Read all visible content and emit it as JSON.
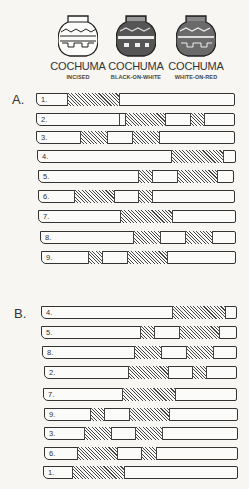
{
  "pots": [
    {
      "title": "COCHUMA",
      "subtitle": "INCISED",
      "style": "incised"
    },
    {
      "title": "COCHUMA",
      "subtitle": "BLACK-ON-WHITE",
      "style": "black-on-white"
    },
    {
      "title": "COCHUMA",
      "subtitle": "WHITE-ON-RED",
      "style": "white-on-red"
    }
  ],
  "sections": [
    {
      "label": "A.",
      "rows": [
        {
          "num": "1.",
          "y": 93,
          "x0": 36,
          "x1": 235,
          "hatches": [
            [
              66,
              117
            ]
          ]
        },
        {
          "num": "2.",
          "y": 113,
          "x0": 36,
          "x1": 235,
          "hatches": [
            [
              124,
              163
            ],
            [
              189,
              202
            ]
          ],
          "divider": 118
        },
        {
          "num": "3.",
          "y": 131,
          "x0": 36,
          "x1": 235,
          "hatches": [
            [
              79,
              105
            ],
            [
              131,
              157
            ]
          ]
        },
        {
          "num": "4.",
          "y": 150,
          "x0": 37,
          "x1": 236,
          "hatches": [
            [
              170,
              221
            ]
          ]
        },
        {
          "num": "5.",
          "y": 170,
          "x0": 38,
          "x1": 234,
          "hatches": [
            [
              137,
              150
            ],
            [
              176,
              215
            ]
          ]
        },
        {
          "num": "6.",
          "y": 190,
          "x0": 38,
          "x1": 235,
          "hatches": [
            [
              73,
              112
            ],
            [
              137,
              150
            ]
          ]
        },
        {
          "num": "7.",
          "y": 210,
          "x0": 38,
          "x1": 236,
          "hatches": [
            [
              119,
              170
            ]
          ]
        },
        {
          "num": "8.",
          "y": 231,
          "x0": 40,
          "x1": 236,
          "hatches": [
            [
              132,
              158
            ],
            [
              184,
              210
            ]
          ]
        },
        {
          "num": "9.",
          "y": 251,
          "x0": 41,
          "x1": 236,
          "hatches": [
            [
              87,
              100
            ],
            [
              126,
              165
            ]
          ]
        }
      ]
    },
    {
      "label": "B.",
      "rows": [
        {
          "num": "4.",
          "y": 306,
          "x0": 41,
          "x1": 237,
          "hatches": [
            [
              171,
              223
            ]
          ]
        },
        {
          "num": "5.",
          "y": 326,
          "x0": 41,
          "x1": 237,
          "hatches": [
            [
              139,
              152
            ],
            [
              178,
              217
            ]
          ]
        },
        {
          "num": "8.",
          "y": 346,
          "x0": 42,
          "x1": 237,
          "hatches": [
            [
              133,
              159
            ],
            [
              185,
              211
            ]
          ]
        },
        {
          "num": "2.",
          "y": 366,
          "x0": 44,
          "x1": 237,
          "hatches": [
            [
              127,
              166
            ],
            [
              191,
              204
            ]
          ]
        },
        {
          "num": "7.",
          "y": 388,
          "x0": 43,
          "x1": 237,
          "hatches": [
            [
              121,
              173
            ]
          ]
        },
        {
          "num": "9.",
          "y": 408,
          "x0": 44,
          "x1": 238,
          "hatches": [
            [
              89,
              102
            ],
            [
              128,
              167
            ]
          ]
        },
        {
          "num": "3.",
          "y": 427,
          "x0": 44,
          "x1": 238,
          "hatches": [
            [
              83,
              109
            ],
            [
              134,
              160
            ]
          ]
        },
        {
          "num": "6.",
          "y": 447,
          "x0": 44,
          "x1": 238,
          "hatches": [
            [
              76,
              115
            ],
            [
              140,
              154
            ]
          ]
        },
        {
          "num": "1.",
          "y": 466,
          "x0": 43,
          "x1": 238,
          "hatches": [
            [
              71,
              122
            ]
          ]
        }
      ]
    }
  ]
}
